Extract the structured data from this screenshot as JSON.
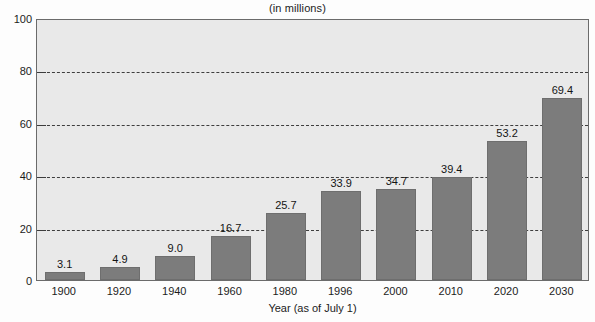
{
  "chart_data": {
    "type": "bar",
    "title": "(in millions)",
    "xlabel": "Year (as of July 1)",
    "ylabel": "",
    "categories": [
      "1900",
      "1920",
      "1940",
      "1960",
      "1980",
      "1996",
      "2000",
      "2010",
      "2020",
      "2030"
    ],
    "values": [
      3.1,
      4.9,
      9.0,
      16.7,
      25.7,
      33.9,
      34.7,
      39.4,
      53.2,
      69.4
    ],
    "value_labels": [
      "3.1",
      "4.9",
      "9.0",
      "16.7",
      "25.7",
      "33.9",
      "34.7",
      "39.4",
      "53.2",
      "69.4"
    ],
    "ylim": [
      0,
      100
    ],
    "yticks": [
      0,
      20,
      40,
      60,
      80,
      100
    ],
    "ytick_labels": [
      "0",
      "20",
      "40",
      "60",
      "80",
      "100"
    ],
    "grid": true,
    "grid_style": "dashed-horizontal",
    "legend": null,
    "bar_color": "#7c7c7c",
    "plot_background": "#e9e9e9",
    "axis_color": "#3d3d3d"
  }
}
